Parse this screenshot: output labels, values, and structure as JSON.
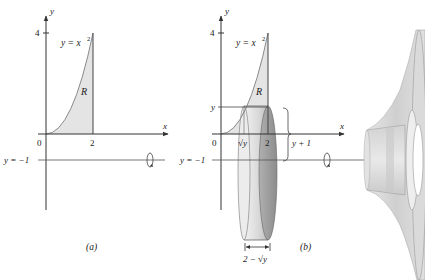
{
  "figure": {
    "caption": "Figure 10.5",
    "panel_a": {
      "label": "(a)",
      "curve_label": "y = x",
      "curve_exponent": "2",
      "region_label": "R",
      "x_axis_label": "x",
      "y_axis_label": "y",
      "y_tick": "4",
      "x_tick_origin": "0",
      "x_tick_2": "2",
      "axis_line_label": "y = −1"
    },
    "panel_b": {
      "label": "(b)",
      "curve_label": "y = x",
      "curve_exponent": "2",
      "region_label": "R",
      "x_axis_label": "x",
      "y_axis_label": "y",
      "y_tick": "4",
      "y_var_tick": "y",
      "x_tick_origin": "0",
      "x_tick_sqrt_y": "√y",
      "x_tick_2": "2",
      "axis_line_label": "y = −1",
      "radius_label": "y + 1",
      "width_label": "2 − √y"
    }
  },
  "colors": {
    "region_fill": "#e4e4e4",
    "axis": "#333333",
    "curve": "#888888",
    "disk_light": "#e8e8e8",
    "disk_dark": "#9a9a9a",
    "solid_mid": "#d6d6d6"
  }
}
